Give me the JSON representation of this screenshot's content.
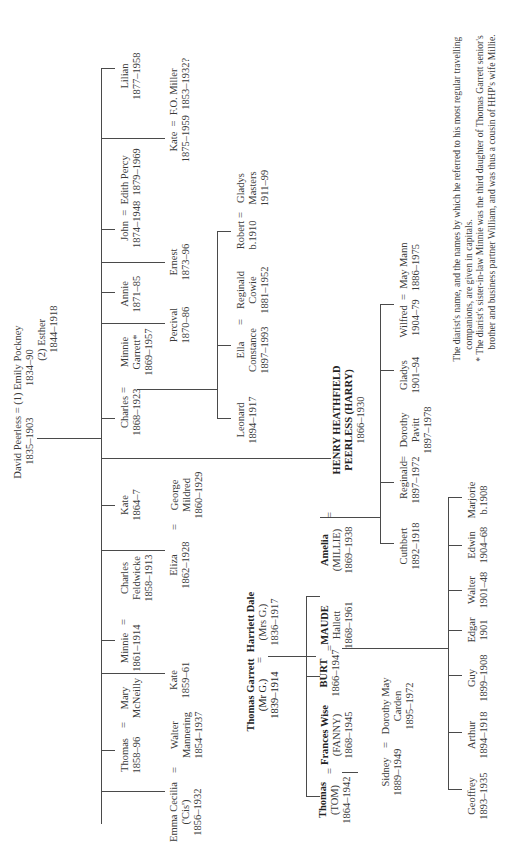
{
  "root": {
    "name": "David Peerless",
    "dates": "1835–1903",
    "wife1": "(1) Emily Pockney",
    "wife1_dates": "1834–90",
    "wife2": "(2) Esther",
    "wife2_dates": "1844–1918",
    "eq": "="
  },
  "peerless_children": [
    {
      "name": "Lilian",
      "dates": "1877–1958"
    },
    {
      "name": "Kate",
      "dates": "1875–1959",
      "spouse": "F.O. Miller",
      "spouse_dates": "1853–1932?"
    },
    {
      "name": "John",
      "dates": "1874–1948",
      "spouse": "Edith Percy",
      "spouse_dates": "1879–1969"
    },
    {
      "name": "Ernest",
      "dates": "1873–96"
    },
    {
      "name": "Annie",
      "dates": "1871–85"
    },
    {
      "name": "Percival",
      "dates": "1870–86"
    },
    {
      "name": "Charles",
      "dates": "1868–1923",
      "spouse_l1": "Minnie",
      "spouse_l2": "Garrett*",
      "spouse_dates": "1869–1957"
    },
    {
      "name": "Kate",
      "dates": "1864–7"
    },
    {
      "name": "Eliza",
      "dates": "1862–1928",
      "spouse_l1": "George",
      "spouse_l2": "Mildred",
      "spouse_dates": "1860–1929"
    },
    {
      "name": "Minnie",
      "dates": "1861–1914",
      "spouse_l1": "Charles",
      "spouse_l2": "Feldwicke",
      "spouse_dates": "1858–1913"
    },
    {
      "name": "Kate",
      "dates": "1859–61"
    },
    {
      "name": "Thomas",
      "dates": "1858–96",
      "spouse_l1": "Mary",
      "spouse_l2": "McNeilly"
    },
    {
      "name": "Emma Cecilia",
      "nick": "('Cis')",
      "dates": "1856–1932",
      "spouse_l1": "Walter",
      "spouse_l2": "Mannering",
      "spouse_dates": "1854–1937"
    }
  ],
  "charles_children": [
    {
      "name": "Leonard",
      "dates": "1894–1917"
    },
    {
      "name": "Ella",
      "l2": "Constance",
      "dates": "1897–1993",
      "spouse_l1": "Reginald",
      "spouse_l2": "Cowie",
      "spouse_dates": "1881–1952"
    },
    {
      "name": "Robert",
      "dates": "b.1910",
      "spouse_l1": "Gladys",
      "spouse_l2": "Masters",
      "spouse_dates": "1911–99"
    }
  ],
  "harry": {
    "l1": "HENRY HEATHFIELD",
    "l2": "PEERLESS (HARRY)",
    "dates": "1866–1930"
  },
  "millie": {
    "l1": "Amelia",
    "l2": "(MILLIE)",
    "dates": "1869–1938"
  },
  "harry_children": [
    {
      "name": "Cuthbert",
      "dates": "1892–1918"
    },
    {
      "name": "Reginald",
      "dates": "1897–1972",
      "spouse_l1": "Dorothy",
      "spouse_l2": "Pavitt",
      "spouse_dates": "1897–1978"
    },
    {
      "name": "Gladys",
      "dates": "1901–94"
    },
    {
      "name": "Wilfred",
      "dates": "1904–79",
      "spouse": "May Mann",
      "spouse_dates": "1886–1975"
    }
  ],
  "garrett": {
    "name": "Thomas Garrett",
    "nick": "(Mr G.)",
    "dates": "1839–1914",
    "wife": "Harriett Dale",
    "wife_nick": "(Mrs G.)",
    "wife_dates": "1836–1917"
  },
  "garrett_children": [
    {
      "l1": "Thomas",
      "l2": "(TOM)",
      "dates": "1864–1942",
      "spouse_l1": "Frances Wise",
      "spouse_l2": "(FANNY)",
      "spouse_dates": "1868–1945"
    },
    {
      "l1": "BURT",
      "dates": "1866–1947",
      "spouse_l1": "MAUDE",
      "spouse_l2": "Hallett",
      "spouse_dates": "1868–1961"
    }
  ],
  "tom_children": [
    {
      "name": "Sidney",
      "dates": "1889–1949",
      "spouse": "Dorothy May",
      "spouse_l2": "Carden",
      "spouse_dates": "1895–1972"
    }
  ],
  "burt_children": [
    {
      "name": "Geoffrey",
      "dates": "1893–1935"
    },
    {
      "name": "Arthur",
      "dates": "1894–1918"
    },
    {
      "name": "Guy",
      "dates": "1899–1908"
    },
    {
      "name": "Edgar",
      "dates": "1901"
    },
    {
      "name": "Walter",
      "dates": "1901–48"
    },
    {
      "name": "Edwin",
      "dates": "1904–68"
    },
    {
      "name": "Marjorie",
      "dates": "b.1908"
    }
  ],
  "notes": {
    "n1a": "The diarist's name, and the names by which he referred to his most regular travelling",
    "n1b": "companions, are given in capitals.",
    "n2a": "* The diarist's sister-in-law Minnie was the third daughter of Thomas Garrett senior's",
    "n2b": "brother and business partner William, and was thus a cousin of HHP's wife Millie."
  }
}
